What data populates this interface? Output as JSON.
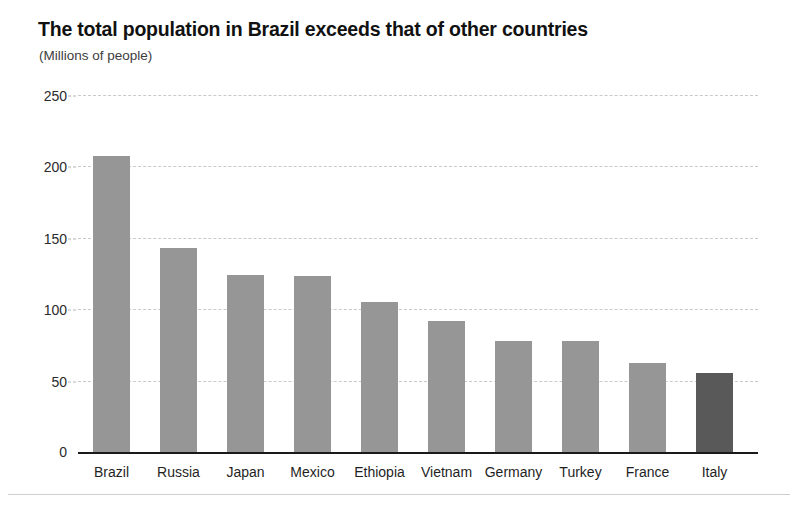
{
  "chart_data": {
    "type": "bar",
    "title": "The total population in Brazil exceeds that of other countries",
    "subtitle": "(Millions of people)",
    "xlabel": "",
    "ylabel": "",
    "categories": [
      "Brazil",
      "Russia",
      "Japan",
      "Mexico",
      "Ethiopia",
      "Vietnam",
      "Germany",
      "Turkey",
      "France",
      "Italy"
    ],
    "values": [
      207,
      143,
      124,
      123,
      105,
      92,
      78,
      78,
      62,
      55
    ],
    "ylim": [
      0,
      250
    ],
    "yticks": [
      0,
      50,
      100,
      150,
      200,
      250
    ],
    "ytick_labels": [
      "0",
      "50",
      "100",
      "150",
      "200",
      "250"
    ],
    "grid": true,
    "grid_style": "dashed-horizontal",
    "legend": "none",
    "bar_color": "#969696",
    "highlight_color": "#595959",
    "highlighted_category": "Italy"
  },
  "colors": {
    "background": "#ffffff",
    "title_text": "#111111",
    "subtitle_text": "#3d3d3d",
    "tick_text": "#2a2a2a",
    "gridline": "#c9c9c9",
    "axis_line": "#1a1a1a",
    "bar": "#969696",
    "bar_highlight": "#595959",
    "footer_rule": "#cfcfcf"
  }
}
